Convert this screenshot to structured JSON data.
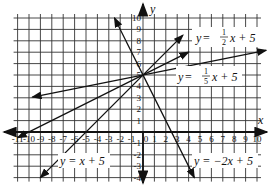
{
  "chart_data": {
    "type": "line",
    "title": "",
    "xlabel": "x",
    "ylabel": "y",
    "xlim": [
      -11,
      10
    ],
    "ylim": [
      -4,
      10
    ],
    "grid": true,
    "x_ticks": [
      -11,
      -10,
      -9,
      -8,
      -7,
      -6,
      -5,
      -4,
      -3,
      -2,
      -1,
      0,
      1,
      2,
      3,
      4,
      5,
      6,
      7,
      8,
      9,
      10
    ],
    "x_tick_labels": [
      "-11",
      "-10",
      "-9",
      "-8",
      "-7",
      "-6",
      "-5",
      "-4",
      "-3",
      "-2",
      "-1",
      "0",
      "1",
      "2",
      "3",
      "4",
      "5",
      "6",
      "7",
      "8",
      "9",
      "10"
    ],
    "y_ticks": [
      10,
      9,
      8,
      7,
      6,
      5,
      4,
      3,
      2,
      1,
      -1,
      -2,
      -3,
      -4
    ],
    "y_tick_labels": [
      "10",
      "9",
      "8",
      "7",
      "6",
      "5",
      "4",
      "3",
      "2",
      "1",
      "-1",
      "-2",
      "-3",
      "-4"
    ],
    "series": [
      {
        "name": "y = 1/2 x + 5",
        "slope": 0.5,
        "intercept": 5,
        "x": [
          -11,
          4
        ],
        "y": [
          -0.5,
          7
        ]
      },
      {
        "name": "y = 1/5 x + 5",
        "slope": 0.2,
        "intercept": 5,
        "x": [
          -9.7,
          10.8
        ],
        "y": [
          3.06,
          7.16
        ]
      },
      {
        "name": "y = x + 5",
        "slope": 1,
        "intercept": 5,
        "x": [
          -9,
          3.5
        ],
        "y": [
          -4,
          8.5
        ]
      },
      {
        "name": "y = -2x + 5",
        "slope": -2,
        "intercept": 5,
        "x": [
          -2.5,
          4.5
        ],
        "y": [
          10,
          -4
        ]
      }
    ],
    "annotations": [
      {
        "text": "y = 1/2 x + 5",
        "position": "upper right"
      },
      {
        "text": "y = 1/5 x + 5",
        "position": "right of y-axis above line"
      },
      {
        "text": "y = x + 5",
        "position": "lower left"
      },
      {
        "text": "y = -2x + 5",
        "position": "lower right"
      }
    ]
  },
  "labels": {
    "x_axis": "x",
    "y_axis": "y",
    "eq_half": {
      "y": "y",
      "eq": " = ",
      "num": "1",
      "den": "2",
      "rest": "x + 5"
    },
    "eq_fifth": {
      "y": "y",
      "eq": " = ",
      "num": "1",
      "den": "5",
      "rest": "x + 5"
    },
    "eq_x": "y = x + 5",
    "eq_neg2": "y = −2x + 5"
  }
}
